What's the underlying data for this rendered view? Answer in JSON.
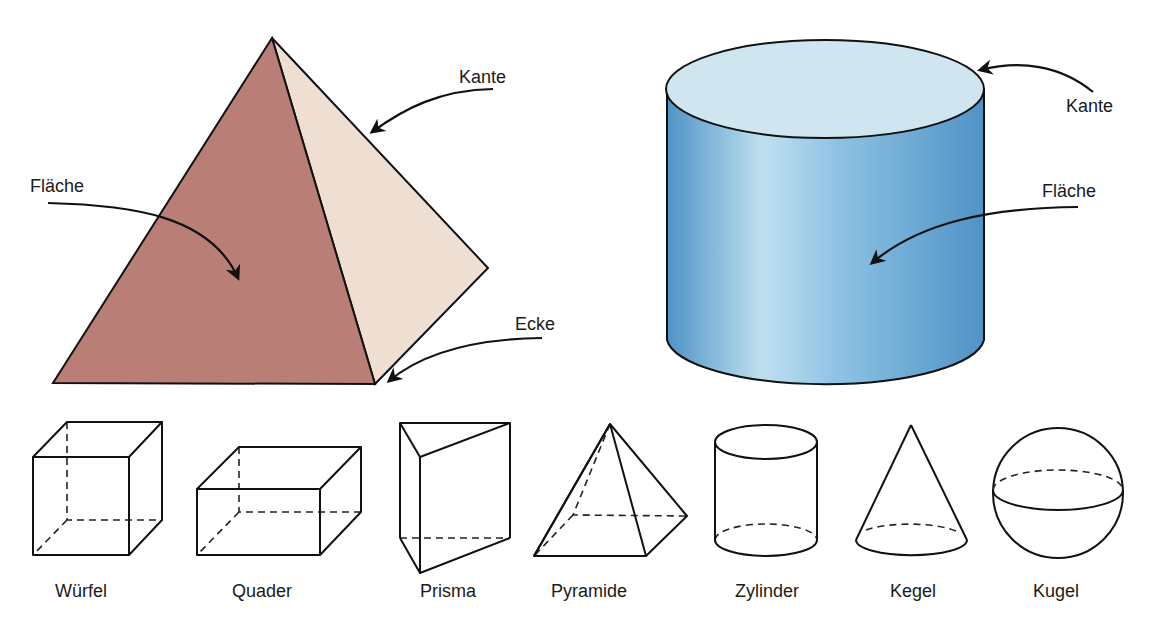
{
  "big_figures": {
    "pyramid": {
      "labels": {
        "face": "Fläche",
        "edge": "Kante",
        "vertex": "Ecke"
      },
      "colors": {
        "front_face": "#b97f77",
        "side_face": "#eedfd2",
        "outline": "#111111"
      }
    },
    "cylinder": {
      "labels": {
        "face": "Fläche",
        "edge": "Kante"
      },
      "colors": {
        "top": "#cfe5f0",
        "body_dark": "#5a9ccc",
        "body_light": "#b9dcee",
        "outline": "#111111"
      }
    }
  },
  "solids": [
    {
      "id": "wuerfel",
      "label": "Würfel"
    },
    {
      "id": "quader",
      "label": "Quader"
    },
    {
      "id": "prisma",
      "label": "Prisma"
    },
    {
      "id": "pyramide",
      "label": "Pyramide"
    },
    {
      "id": "zylinder",
      "label": "Zylinder"
    },
    {
      "id": "kegel",
      "label": "Kegel"
    },
    {
      "id": "kugel",
      "label": "Kugel"
    }
  ]
}
